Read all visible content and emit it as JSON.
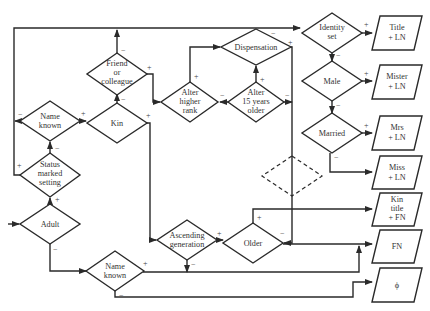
{
  "diagram": {
    "type": "flowchart",
    "decisions": [
      {
        "id": "adult",
        "label": [
          "Adult"
        ]
      },
      {
        "id": "status",
        "label": [
          "Status",
          "marked",
          "setting"
        ]
      },
      {
        "id": "name_known_top",
        "label": [
          "Name",
          "known"
        ]
      },
      {
        "id": "kin",
        "label": [
          "Kin"
        ]
      },
      {
        "id": "friend",
        "label": [
          "Friend",
          "or",
          "colleague"
        ]
      },
      {
        "id": "alter_rank",
        "label": [
          "Alter",
          "higher",
          "rank"
        ]
      },
      {
        "id": "alter_older",
        "label": [
          "Alter",
          "15 years",
          "older"
        ]
      },
      {
        "id": "dispensation",
        "label": [
          "Dispensation"
        ]
      },
      {
        "id": "identity",
        "label": [
          "Identity",
          "set"
        ]
      },
      {
        "id": "male",
        "label": [
          "Male"
        ]
      },
      {
        "id": "married",
        "label": [
          "Married"
        ]
      },
      {
        "id": "ascending",
        "label": [
          "Ascending",
          "generation"
        ]
      },
      {
        "id": "older",
        "label": [
          "Older"
        ]
      },
      {
        "id": "name_known_bottom",
        "label": [
          "Name",
          "known"
        ]
      },
      {
        "id": "unlabeled_dashed",
        "label": []
      }
    ],
    "outputs": [
      {
        "id": "title_ln",
        "label": [
          "Title",
          "+ LN"
        ]
      },
      {
        "id": "mister_ln",
        "label": [
          "Mister",
          "+ LN"
        ]
      },
      {
        "id": "mrs_ln",
        "label": [
          "Mrs",
          "+ LN"
        ]
      },
      {
        "id": "miss_ln",
        "label": [
          "Miss",
          "+ LN"
        ]
      },
      {
        "id": "kin_title_fn",
        "label": [
          "Kin",
          "title",
          "+ FN"
        ]
      },
      {
        "id": "fn",
        "label": [
          "FN"
        ]
      },
      {
        "id": "phi",
        "label": [
          "ϕ"
        ]
      }
    ],
    "signs": {
      "plus": "+",
      "minus": "−"
    }
  }
}
